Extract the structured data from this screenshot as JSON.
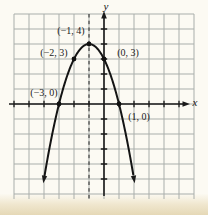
{
  "figure": {
    "kind": "math-textbook-graph"
  },
  "chart_data": {
    "type": "line",
    "title": "",
    "xlabel": "x",
    "ylabel": "y",
    "x_range": [
      -6,
      6
    ],
    "y_range": [
      -6,
      6
    ],
    "grid": true,
    "curve": {
      "shape": "parabola",
      "opens": "down",
      "vertex": [
        -1,
        4
      ],
      "coefficient": -1,
      "t_min": -3.97,
      "t_max": 1.97
    },
    "axis_of_symmetry_x": -1,
    "labeled_points": [
      {
        "x": -1,
        "y": 4,
        "label": "(−1, 4)",
        "label_px": [
          71,
          31
        ]
      },
      {
        "x": -2,
        "y": 3,
        "label": "(−2, 3)",
        "label_px": [
          54,
          53
        ]
      },
      {
        "x": 0,
        "y": 3,
        "label": "(0, 3)",
        "label_px": [
          128,
          53
        ]
      },
      {
        "x": -3,
        "y": 0,
        "label": "(−3, 0)",
        "label_px": [
          44,
          93
        ]
      },
      {
        "x": 1,
        "y": 0,
        "label": "(1, 0)",
        "label_px": [
          139,
          117
        ]
      }
    ],
    "axis_letter_px": {
      "x": [
        195,
        102
      ],
      "y": [
        106,
        6
      ]
    }
  },
  "colors": {
    "background": "#fcfaf3",
    "bottom_band": "#e5d8b6",
    "grid": "#a9aeab",
    "ink": "#1a1a1a"
  }
}
